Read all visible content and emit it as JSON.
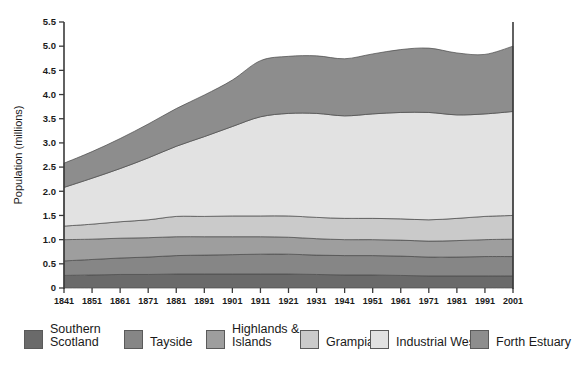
{
  "chart_data": {
    "type": "area",
    "stacked": true,
    "title": "",
    "xlabel": "",
    "ylabel": "Population (millions)",
    "ylim": [
      0,
      5.5
    ],
    "yticks": [
      "0",
      "0.5",
      "1.0",
      "1.5",
      "2.0",
      "2.5",
      "3.0",
      "3.5",
      "4.0",
      "4.5",
      "5.0",
      "5.5"
    ],
    "ytick_values": [
      0,
      0.5,
      1.0,
      1.5,
      2.0,
      2.5,
      3.0,
      3.5,
      4.0,
      4.5,
      5.0,
      5.5
    ],
    "grid": false,
    "legend_position": "bottom",
    "categories": [
      1841,
      1851,
      1861,
      1871,
      1881,
      1891,
      1901,
      1911,
      1921,
      1931,
      1941,
      1951,
      1961,
      1971,
      1981,
      1991,
      2001
    ],
    "xtick_labels": [
      "1841",
      "1851",
      "1861",
      "1871",
      "1881",
      "1891",
      "1901",
      "1911",
      "1921",
      "1931",
      "1941",
      "1951",
      "1961",
      "1971",
      "1981",
      "1991",
      "2001"
    ],
    "series": [
      {
        "name": "Southern Scotland",
        "color": "#6a6a6a",
        "values": [
          0.26,
          0.27,
          0.28,
          0.28,
          0.29,
          0.29,
          0.29,
          0.29,
          0.29,
          0.28,
          0.27,
          0.27,
          0.26,
          0.25,
          0.25,
          0.25,
          0.25
        ]
      },
      {
        "name": "Tayside",
        "color": "#868686",
        "values": [
          0.3,
          0.32,
          0.34,
          0.36,
          0.38,
          0.39,
          0.4,
          0.41,
          0.41,
          0.4,
          0.4,
          0.4,
          0.4,
          0.39,
          0.39,
          0.4,
          0.4
        ]
      },
      {
        "name": "Highlands & Islands",
        "color": "#9e9e9e",
        "values": [
          0.44,
          0.42,
          0.41,
          0.4,
          0.39,
          0.38,
          0.37,
          0.36,
          0.35,
          0.34,
          0.33,
          0.33,
          0.33,
          0.33,
          0.34,
          0.35,
          0.36
        ]
      },
      {
        "name": "Grampian",
        "color": "#cacaca",
        "values": [
          0.28,
          0.31,
          0.34,
          0.37,
          0.42,
          0.42,
          0.43,
          0.43,
          0.44,
          0.44,
          0.44,
          0.44,
          0.44,
          0.44,
          0.46,
          0.48,
          0.49
        ]
      },
      {
        "name": "Industrial West",
        "color": "#e2e2e2",
        "values": [
          0.8,
          0.95,
          1.1,
          1.28,
          1.45,
          1.65,
          1.85,
          2.05,
          2.12,
          2.15,
          2.12,
          2.16,
          2.2,
          2.22,
          2.14,
          2.12,
          2.15
        ]
      },
      {
        "name": "Forth Estuary",
        "color": "#8d8d8d",
        "values": [
          0.5,
          0.55,
          0.62,
          0.7,
          0.78,
          0.86,
          0.96,
          1.16,
          1.18,
          1.19,
          1.18,
          1.24,
          1.3,
          1.33,
          1.28,
          1.23,
          1.35
        ]
      }
    ],
    "totals": [
      2.58,
      2.82,
      3.09,
      3.39,
      3.71,
      3.99,
      4.3,
      4.7,
      4.79,
      4.8,
      4.74,
      4.84,
      4.93,
      4.96,
      4.86,
      4.83,
      5.0
    ]
  },
  "legend": {
    "items": [
      {
        "label": "Southern\nScotland",
        "color": "#6a6a6a",
        "name": "legend-item-southern-scotland"
      },
      {
        "label": "Tayside",
        "color": "#868686",
        "name": "legend-item-tayside"
      },
      {
        "label": "Highlands &\nIslands",
        "color": "#9e9e9e",
        "name": "legend-item-highlands-islands"
      },
      {
        "label": "Grampian",
        "color": "#cacaca",
        "name": "legend-item-grampian"
      },
      {
        "label": "Industrial West",
        "color": "#e2e2e2",
        "name": "legend-item-industrial-west"
      },
      {
        "label": "Forth Estuary",
        "color": "#8d8d8d",
        "name": "legend-item-forth-estuary"
      }
    ]
  },
  "axis": {
    "y_title": "Population (millions)"
  },
  "colors": {
    "axis": "#3a3a3a",
    "text": "#1a1a1a",
    "background": "#ffffff"
  }
}
